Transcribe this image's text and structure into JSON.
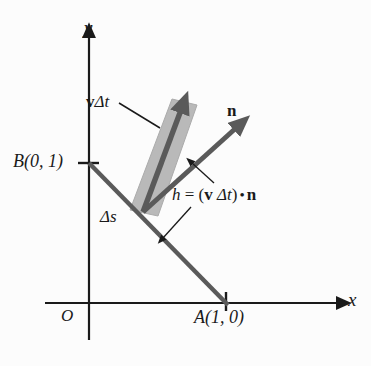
{
  "figure": {
    "name": "flux-through-segment-diagram",
    "background_color": "#fcfcfc"
  },
  "axes": {
    "x_label": "x",
    "y_label": "y",
    "origin_label": "O",
    "axis_color": "#1a1a1a"
  },
  "points": {
    "B": "B(0, 1)",
    "A": "A(1, 0)"
  },
  "labels": {
    "velocity_displacement": {
      "bold_part": "v",
      "italic_part": "Δt",
      "full": "vΔt"
    },
    "normal_vector": "n",
    "segment_length": "Δs",
    "height_formula": {
      "h": "h",
      "equals": "=",
      "open_paren": "(",
      "v": "v",
      "delta_t": "Δt",
      "close_paren": ")",
      "dot": "•",
      "n": "n",
      "full": "h = (v Δt) • n"
    }
  },
  "colors": {
    "line_gray": "#5a5a5a",
    "band_fill": "#b9b9b9",
    "band_stroke": "#a8a8a8",
    "ink": "#1a1a1a"
  },
  "geometry": {
    "x_axis": {
      "x1": 45,
      "y1": 303,
      "x2": 345,
      "y2": 303
    },
    "y_axis": {
      "x1": 89,
      "y1": 338,
      "x2": 89,
      "y2": 28
    },
    "segment_AB": {
      "x1": 89,
      "y1": 163,
      "x2": 226,
      "y2": 303
    },
    "base_point": {
      "x": 143,
      "y": 212
    },
    "v_dt_tip": {
      "x": 184,
      "y": 106
    },
    "n_tip": {
      "x": 242,
      "y": 123
    },
    "band_width": 28
  }
}
